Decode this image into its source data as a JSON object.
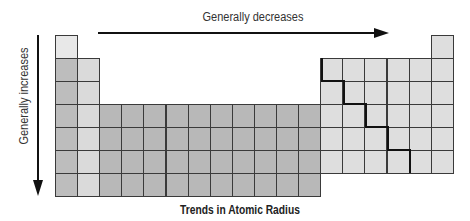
{
  "diagram": {
    "title": "Trends in Atomic Radius",
    "horizontal_trend": {
      "label": "Generally decreases",
      "direction": "left-to-right"
    },
    "vertical_trend": {
      "label": "Generally increases",
      "direction": "top-to-bottom"
    },
    "colors": {
      "hydrogen": "#e8e8e8",
      "group1": "#bdbdbd",
      "group2": "#dadada",
      "transition": "#b8b8b8",
      "p_block": "#dedede",
      "grid_line": "#3a3a3a",
      "metalloid_line": "#111111"
    },
    "grid": {
      "origin_x": 55,
      "origin_y": 35,
      "cell_w": 22.1,
      "cell_h": 23,
      "periods": 7,
      "groups": 18
    }
  }
}
